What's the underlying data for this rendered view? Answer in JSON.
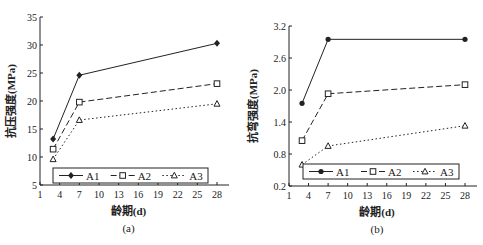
{
  "chart_data": [
    {
      "type": "line",
      "panel_label": "(a)",
      "title": "",
      "xlabel": "龄期(d)",
      "ylabel": "抗压强度(MPa)",
      "xlim": [
        1,
        28
      ],
      "ylim": [
        5,
        35
      ],
      "xticks": [
        1,
        4,
        7,
        10,
        13,
        16,
        19,
        22,
        25,
        28
      ],
      "yticks": [
        5,
        10,
        15,
        20,
        25,
        30,
        35
      ],
      "grid": false,
      "legend_position": "bottom-inside",
      "x": [
        3,
        7,
        28
      ],
      "series": [
        {
          "name": "A1",
          "marker": "filled-diamond",
          "line": "solid",
          "values": [
            13.2,
            24.6,
            30.3
          ]
        },
        {
          "name": "A2",
          "marker": "open-square",
          "line": "dashed",
          "values": [
            11.4,
            19.8,
            23.1
          ]
        },
        {
          "name": "A3",
          "marker": "open-triangle",
          "line": "dotted",
          "values": [
            9.6,
            16.6,
            19.5
          ]
        }
      ]
    },
    {
      "type": "line",
      "panel_label": "(b)",
      "title": "",
      "xlabel": "龄期(d)",
      "ylabel": "抗弯强度(MPa)",
      "xlim": [
        1,
        28
      ],
      "ylim": [
        0.2,
        3.2
      ],
      "xticks": [
        1,
        4,
        7,
        10,
        13,
        16,
        19,
        22,
        25,
        28
      ],
      "yticks": [
        0.2,
        0.8,
        1.4,
        2.0,
        2.6,
        3.2
      ],
      "ytick_labels": [
        "0.2",
        "0.8",
        "1.4",
        "2.0",
        "2.6",
        "3.2"
      ],
      "grid": false,
      "legend_position": "bottom-inside",
      "x": [
        3,
        7,
        28
      ],
      "series": [
        {
          "name": "A1",
          "marker": "filled-circle",
          "line": "solid",
          "values": [
            1.75,
            2.95,
            2.95
          ]
        },
        {
          "name": "A2",
          "marker": "open-square",
          "line": "dashed",
          "values": [
            1.05,
            1.93,
            2.1
          ]
        },
        {
          "name": "A3",
          "marker": "open-triangle",
          "line": "dotted",
          "values": [
            0.6,
            0.95,
            1.33
          ]
        }
      ]
    }
  ],
  "colors": {
    "line": "#222222",
    "axis": "#222222",
    "background": "#ffffff"
  }
}
